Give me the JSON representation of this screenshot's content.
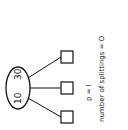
{
  "diagram": {
    "root_node": {
      "values": [
        "10",
        "30"
      ]
    },
    "child_count": 3,
    "caption": {
      "p_label": "p = l",
      "splittings_label": "number of splittings = O"
    },
    "colors": {
      "stroke": "#111111",
      "background": "#ffffff"
    }
  }
}
